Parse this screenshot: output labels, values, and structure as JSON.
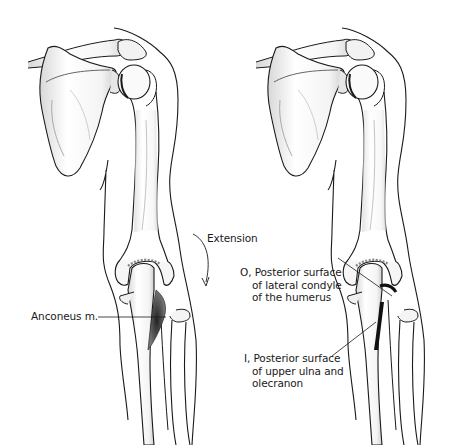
{
  "figure": {
    "panels": [
      {
        "id": "left",
        "description": "Posterior view of right shoulder and arm showing elbow extension",
        "labels": {
          "motion": "Extension",
          "muscle": "Anconeus m."
        }
      },
      {
        "id": "right",
        "description": "Posterior view showing origin and insertion of anconeus",
        "labels": {
          "origin_line1": "O, Posterior surface",
          "origin_line2": "of lateral condyle",
          "origin_line3": "of the humerus",
          "insertion_line1": "I, Posterior surface",
          "insertion_line2": "of upper ulna and",
          "insertion_line3": "olecranon"
        }
      }
    ],
    "colors": {
      "line": "#1a1a1a",
      "shade": "#9a9a9a",
      "muscle": "#3a3a3a",
      "background": "#ffffff"
    }
  }
}
